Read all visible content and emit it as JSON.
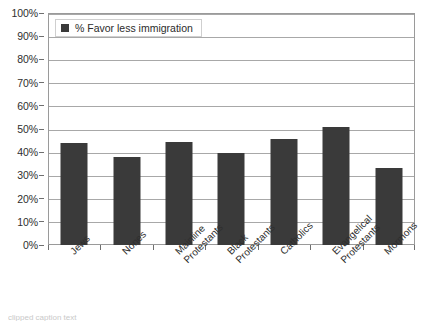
{
  "chart_data": {
    "type": "bar",
    "title": "",
    "subtitle": "",
    "xlabel": "",
    "ylabel": "",
    "categories": [
      "Jews",
      "Nones",
      "Mainline Protestants",
      "Black Protestants",
      "Catholics",
      "Evangelical Protestants",
      "Mormons"
    ],
    "values": [
      44,
      38,
      44.5,
      39.5,
      45.5,
      51,
      33
    ],
    "series": [
      {
        "name": "% Favor less immigration",
        "values": [
          44,
          38,
          44.5,
          39.5,
          45.5,
          51,
          33
        ]
      }
    ],
    "ylim": [
      0,
      100
    ],
    "ytick_values": [
      0,
      10,
      20,
      30,
      40,
      50,
      60,
      70,
      80,
      90,
      100
    ],
    "ytick_labels": [
      "0%",
      "10%",
      "20%",
      "30%",
      "40%",
      "50%",
      "60%",
      "70%",
      "80%",
      "90%",
      "100%"
    ],
    "value_suffix": "%",
    "grid": true,
    "grid_axis": "y",
    "legend_position": "top-left",
    "bar_color": "#3a3a3a",
    "grid_color": "#a8a8a8",
    "frame_color": "#9a9a9a"
  },
  "legend": {
    "entries": [
      {
        "label": "% Favor less immigration",
        "color": "#3a3a3a"
      }
    ]
  },
  "caption": {
    "text": "clipped caption text"
  }
}
